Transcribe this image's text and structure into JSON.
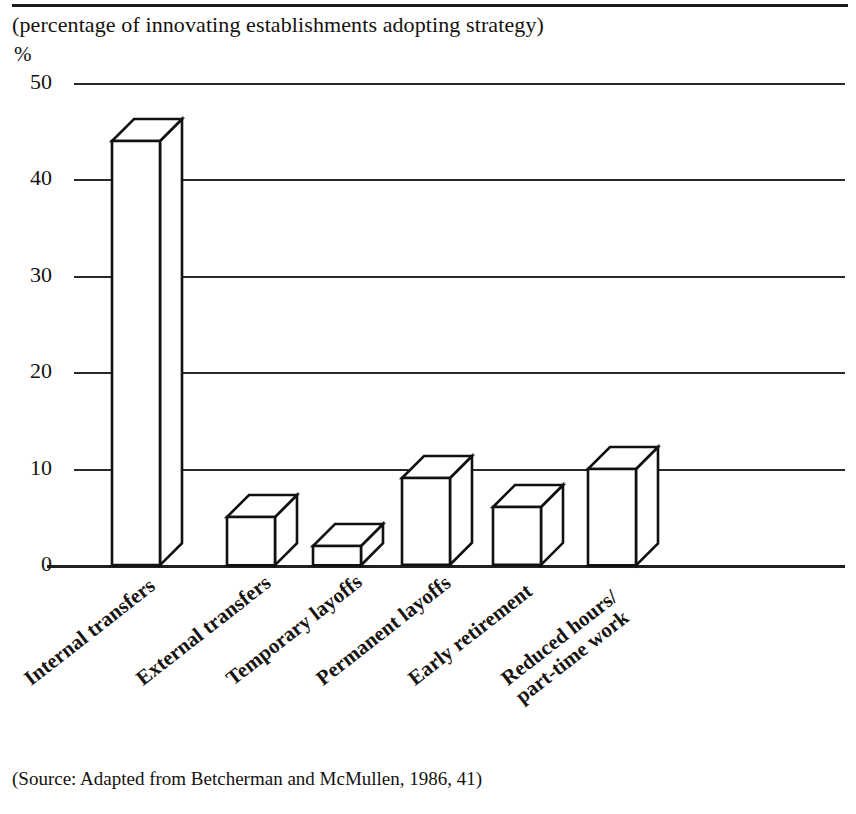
{
  "document": {
    "title": "(percentage of innovating establishments adopting strategy)",
    "source_note": "(Source: Adapted from Betcherman and McMullen, 1986, 41)"
  },
  "chart_data": {
    "type": "bar",
    "title": "(percentage of innovating establishments adopting strategy)",
    "xlabel": "",
    "ylabel": "%",
    "ylim": [
      0,
      50
    ],
    "yticks": [
      0,
      10,
      20,
      30,
      40,
      50
    ],
    "ytick_labels": [
      "0",
      "10",
      "20",
      "30",
      "40",
      "50"
    ],
    "grid": true,
    "legend": "none",
    "style": "3d-isometric-outline",
    "categories": [
      "Internal transfers",
      "External transfers",
      "Temporary layoffs",
      "Permanent layoffs",
      "Early retirement",
      "Reduced hours/ part-time work"
    ],
    "category_lines": [
      [
        "Internal transfers"
      ],
      [
        "External transfers"
      ],
      [
        "Temporary layoffs"
      ],
      [
        "Permanent layoffs"
      ],
      [
        "Early retirement"
      ],
      [
        "Reduced hours/",
        "part-time work"
      ]
    ],
    "values": [
      44,
      5,
      2,
      9,
      6,
      10
    ]
  },
  "colors": {
    "ink": "#15120f",
    "bar_fill": "#ffffff",
    "bar_stroke": "#111111",
    "grid": "#2a2a2a",
    "background": "#ffffff"
  }
}
